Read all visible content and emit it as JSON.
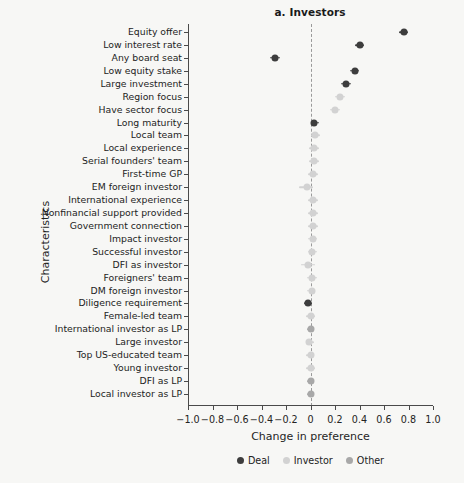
{
  "chart_data": {
    "type": "scatter",
    "title": "a. Investors",
    "xlabel": "Change in preference",
    "ylabel": "Characteristics",
    "xlim": [
      -1.0,
      1.0
    ],
    "xticks": [
      -1.0,
      -0.8,
      -0.6,
      -0.4,
      -0.2,
      0,
      0.2,
      0.4,
      0.6,
      0.8,
      1.0
    ],
    "xticklabels": [
      "-1.0",
      "-0.8",
      "-0.6",
      "-0.4",
      "-0.2",
      "0",
      "0.2",
      "0.4",
      "0.6",
      "0.8",
      "1.0"
    ],
    "grid": false,
    "reference_line": 0,
    "legend_position": "bottom",
    "legend": [
      {
        "name": "Deal",
        "color": "#3d3d3d"
      },
      {
        "name": "Investor",
        "color": "#d2d2d2"
      },
      {
        "name": "Other",
        "color": "#a8a8a8"
      }
    ],
    "categories": [
      "Equity offer",
      "Low interest rate",
      "Any board seat",
      "Low equity stake",
      "Large investment",
      "Region focus",
      "Have sector focus",
      "Long maturity",
      "Local team",
      "Local experience",
      "Serial founders' team",
      "First-time GP",
      "EM foreign investor",
      "International experience",
      "Nonfinancial support provided",
      "Government connection",
      "Impact investor",
      "Successful investor",
      "DFI as investor",
      "Foreigners' team",
      "DM foreign investor",
      "Diligence requirement",
      "Female-led team",
      "International investor as LP",
      "Large investor",
      "Top US-educated team",
      "Young investor",
      "DFI as LP",
      "Local investor as LP"
    ],
    "points": [
      {
        "label": "Equity offer",
        "value": 0.76,
        "lo": 0.72,
        "hi": 0.8,
        "group": "Deal"
      },
      {
        "label": "Low interest rate",
        "value": 0.4,
        "lo": 0.36,
        "hi": 0.44,
        "group": "Deal"
      },
      {
        "label": "Any board seat",
        "value": -0.29,
        "lo": -0.33,
        "hi": -0.25,
        "group": "Deal"
      },
      {
        "label": "Low equity stake",
        "value": 0.36,
        "lo": 0.32,
        "hi": 0.4,
        "group": "Deal"
      },
      {
        "label": "Large investment",
        "value": 0.29,
        "lo": 0.25,
        "hi": 0.33,
        "group": "Deal"
      },
      {
        "label": "Region focus",
        "value": 0.24,
        "lo": 0.2,
        "hi": 0.28,
        "group": "Investor"
      },
      {
        "label": "Have sector focus",
        "value": 0.2,
        "lo": 0.16,
        "hi": 0.24,
        "group": "Investor"
      },
      {
        "label": "Long maturity",
        "value": 0.03,
        "lo": 0.0,
        "hi": 0.07,
        "group": "Deal"
      },
      {
        "label": "Local team",
        "value": 0.04,
        "lo": 0.0,
        "hi": 0.08,
        "group": "Investor"
      },
      {
        "label": "Local experience",
        "value": 0.03,
        "lo": -0.01,
        "hi": 0.07,
        "group": "Investor"
      },
      {
        "label": "Serial founders' team",
        "value": 0.03,
        "lo": -0.01,
        "hi": 0.07,
        "group": "Investor"
      },
      {
        "label": "First-time GP",
        "value": 0.02,
        "lo": -0.02,
        "hi": 0.06,
        "group": "Investor"
      },
      {
        "label": "EM foreign investor",
        "value": -0.03,
        "lo": -0.09,
        "hi": 0.02,
        "group": "Investor"
      },
      {
        "label": "International experience",
        "value": 0.02,
        "lo": -0.02,
        "hi": 0.06,
        "group": "Investor"
      },
      {
        "label": "Nonfinancial support provided",
        "value": 0.02,
        "lo": -0.02,
        "hi": 0.06,
        "group": "Investor"
      },
      {
        "label": "Government connection",
        "value": 0.02,
        "lo": -0.02,
        "hi": 0.06,
        "group": "Investor"
      },
      {
        "label": "Impact investor",
        "value": 0.02,
        "lo": -0.02,
        "hi": 0.05,
        "group": "Investor"
      },
      {
        "label": "Successful investor",
        "value": 0.01,
        "lo": -0.02,
        "hi": 0.05,
        "group": "Investor"
      },
      {
        "label": "DFI as investor",
        "value": -0.02,
        "lo": -0.08,
        "hi": 0.04,
        "group": "Investor"
      },
      {
        "label": "Foreigners' team",
        "value": 0.01,
        "lo": -0.03,
        "hi": 0.05,
        "group": "Investor"
      },
      {
        "label": "DM foreign investor",
        "value": 0.01,
        "lo": -0.03,
        "hi": 0.04,
        "group": "Investor"
      },
      {
        "label": "Diligence requirement",
        "value": -0.02,
        "lo": -0.05,
        "hi": 0.01,
        "group": "Deal"
      },
      {
        "label": "Female-led team",
        "value": 0.0,
        "lo": -0.04,
        "hi": 0.04,
        "group": "Investor"
      },
      {
        "label": "International investor as LP",
        "value": 0.0,
        "lo": -0.03,
        "hi": 0.03,
        "group": "Other"
      },
      {
        "label": "Large investor",
        "value": -0.01,
        "lo": -0.04,
        "hi": 0.03,
        "group": "Investor"
      },
      {
        "label": "Top US-educated team",
        "value": 0.0,
        "lo": -0.04,
        "hi": 0.03,
        "group": "Investor"
      },
      {
        "label": "Young investor",
        "value": 0.0,
        "lo": -0.04,
        "hi": 0.04,
        "group": "Investor"
      },
      {
        "label": "DFI as LP",
        "value": 0.0,
        "lo": -0.03,
        "hi": 0.03,
        "group": "Other"
      },
      {
        "label": "Local investor as LP",
        "value": 0.0,
        "lo": -0.03,
        "hi": 0.03,
        "group": "Other"
      }
    ]
  }
}
